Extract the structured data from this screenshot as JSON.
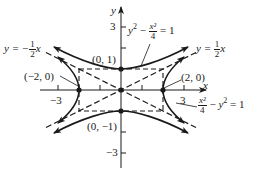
{
  "figure": {
    "type": "hyperbola-diagram",
    "axes": {
      "x_label": "x",
      "y_label": "y",
      "x_ticks": [
        -3,
        -2,
        -1,
        1,
        2,
        3
      ],
      "y_ticks": [
        -3,
        -2,
        -1,
        1,
        2,
        3
      ],
      "x_tick_labels": {
        "neg": "−3",
        "pos": "3"
      },
      "y_tick_labels": {
        "neg": "−3",
        "pos": "3"
      }
    },
    "curves": [
      {
        "name": "vertical-hyperbola",
        "equation": "y² − x²/4 = 1",
        "vertices": [
          "(0, 1)",
          "(0, −1)"
        ]
      },
      {
        "name": "horizontal-hyperbola",
        "equation": "x²/4 − y² = 1",
        "vertices": [
          "(2, 0)",
          "(−2, 0)"
        ]
      }
    ],
    "asymptotes": [
      {
        "equation": "y = ½x",
        "slope": 0.5
      },
      {
        "equation": "y = −½x",
        "slope": -0.5
      }
    ],
    "point_labels": {
      "top": "(0, 1)",
      "bottom": "(0, −1)",
      "left": "(−2, 0)",
      "right": "(2, 0)"
    },
    "equation_labels": {
      "upper": {
        "lhs_term": "y",
        "exp": "2",
        "minus": "−",
        "num": "x²",
        "den": "4",
        "rhs": "= 1"
      },
      "lower": {
        "num": "x²",
        "den": "4",
        "minus": "−",
        "rhs_term": "y",
        "exp": "2",
        "rhs": "= 1"
      },
      "asym_pos": {
        "prefix": "y =",
        "num": "1",
        "den": "2",
        "suffix": "x"
      },
      "asym_neg": {
        "prefix": "y = −",
        "num": "1",
        "den": "2",
        "suffix": "x"
      }
    },
    "colors": {
      "ink": "#1a1a1a",
      "background": "#ffffff"
    }
  }
}
